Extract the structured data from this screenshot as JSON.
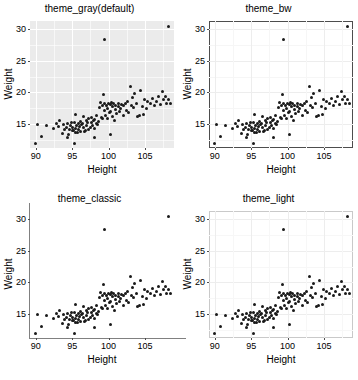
{
  "figure": {
    "layout": "2x2 grid of scatter plots",
    "panel_count": 4
  },
  "panels": [
    {
      "title": "theme_gray(default)",
      "theme": "gray"
    },
    {
      "title": "theme_bw",
      "theme": "bw"
    },
    {
      "title": "theme_classic",
      "theme": "classic"
    },
    {
      "title": "theme_light",
      "theme": "light"
    }
  ],
  "axis": {
    "xlabel": "Height",
    "ylabel": "Weight",
    "xticks": [
      "90",
      "95",
      "100",
      "105"
    ],
    "yticks": [
      "30",
      "25",
      "20",
      "15"
    ]
  },
  "chart_data": {
    "type": "scatter",
    "xlabel": "Height",
    "ylabel": "Weight",
    "xlim": [
      89.2,
      109.0
    ],
    "ylim": [
      11.2,
      31.3
    ],
    "xticks": [
      90,
      95,
      100,
      105
    ],
    "yticks": [
      15,
      20,
      25,
      30
    ],
    "grid": true,
    "legend": null,
    "point_color": "#1a1a1a",
    "panel_themes": [
      "theme_gray(default)",
      "theme_bw",
      "theme_classic",
      "theme_light"
    ],
    "note": "All four panels plot the identical dataset; only the ggplot2 theme differs.",
    "x": [
      90.0,
      90.2,
      90.8,
      91.5,
      92.4,
      92.8,
      93.1,
      93.3,
      93.6,
      93.8,
      94.0,
      94.2,
      94.4,
      94.5,
      94.6,
      94.8,
      94.9,
      95.0,
      95.1,
      95.2,
      95.3,
      95.4,
      95.5,
      95.6,
      95.7,
      95.8,
      95.9,
      96.0,
      96.1,
      96.2,
      96.3,
      96.4,
      96.5,
      96.6,
      96.8,
      96.9,
      97.0,
      97.1,
      97.2,
      97.3,
      97.5,
      97.6,
      97.7,
      97.8,
      97.9,
      98.0,
      98.1,
      98.3,
      98.4,
      98.5,
      98.6,
      98.8,
      98.9,
      99.0,
      99.1,
      99.2,
      99.3,
      99.4,
      99.5,
      99.6,
      99.7,
      99.8,
      99.9,
      100.0,
      100.1,
      100.2,
      100.3,
      100.4,
      100.5,
      100.6,
      100.7,
      100.8,
      100.9,
      101.0,
      101.1,
      101.3,
      101.4,
      101.5,
      101.6,
      101.8,
      102.0,
      102.1,
      102.3,
      102.5,
      102.6,
      102.8,
      103.0,
      103.1,
      103.3,
      103.4,
      103.6,
      103.8,
      104.0,
      104.2,
      104.4,
      104.6,
      104.8,
      105.0,
      105.2,
      105.4,
      105.8,
      106.0,
      106.3,
      106.6,
      106.9,
      107.1,
      107.4,
      107.6,
      107.8,
      108.0,
      108.3,
      108.5,
      99.4,
      108.2,
      95.3,
      95.5,
      98.0,
      100.2,
      94.3,
      96.7
    ],
    "y": [
      11.9,
      14.9,
      13.0,
      14.8,
      14.3,
      15.1,
      14.6,
      15.5,
      13.5,
      14.9,
      14.2,
      14.4,
      15.0,
      13.3,
      14.1,
      14.7,
      15.3,
      14.0,
      14.5,
      13.9,
      15.2,
      14.3,
      16.5,
      14.8,
      13.7,
      15.0,
      14.2,
      14.6,
      15.4,
      13.8,
      14.9,
      15.1,
      14.4,
      16.2,
      14.0,
      15.6,
      14.7,
      15.3,
      14.1,
      15.9,
      14.5,
      15.2,
      16.0,
      14.8,
      15.5,
      14.3,
      15.7,
      15.0,
      16.3,
      14.9,
      15.4,
      17.6,
      18.4,
      16.1,
      17.9,
      15.8,
      19.6,
      18.2,
      17.1,
      16.4,
      18.0,
      15.9,
      17.4,
      18.3,
      16.8,
      18.1,
      17.0,
      18.4,
      16.2,
      17.7,
      18.2,
      15.6,
      17.3,
      18.0,
      16.6,
      17.8,
      18.3,
      16.9,
      17.5,
      18.1,
      16.4,
      17.9,
      18.2,
      17.2,
      18.5,
      16.8,
      20.9,
      18.0,
      19.2,
      17.6,
      19.8,
      18.3,
      16.2,
      16.4,
      20.3,
      17.8,
      16.5,
      18.9,
      17.4,
      18.6,
      18.2,
      19.0,
      17.9,
      18.5,
      19.3,
      18.1,
      20.1,
      18.8,
      19.4,
      18.3,
      18.9,
      18.2,
      28.4,
      30.5,
      11.9,
      13.6,
      12.8,
      13.3,
      12.9,
      13.8
    ]
  }
}
